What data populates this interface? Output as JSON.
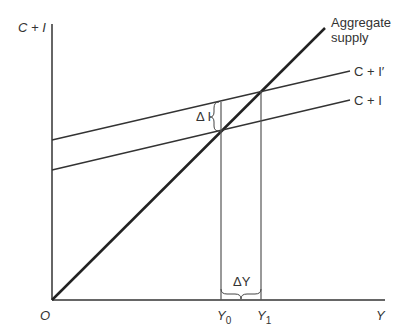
{
  "diagram": {
    "type": "keynesian-cross",
    "axes": {
      "y_label": "C + I",
      "x_label": "Y",
      "origin_label": "O"
    },
    "lines": {
      "aggregate_supply": {
        "label_line1": "Aggregate",
        "label_line2": "supply"
      },
      "c_plus_i_prime": {
        "label": "C + I′"
      },
      "c_plus_i": {
        "label": "C + I"
      }
    },
    "annotations": {
      "delta_i": "Δ I",
      "delta_y": "ΔY",
      "y0_base": "Y",
      "y0_sub": "0",
      "y1_base": "Y",
      "y1_sub": "1"
    },
    "colors": {
      "axis": "#666666",
      "aggregate_supply": "#222222",
      "lines": "#333333",
      "text": "#333333"
    }
  }
}
